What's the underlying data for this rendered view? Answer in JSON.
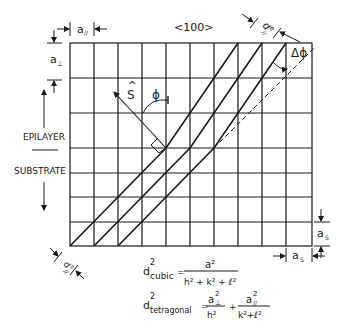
{
  "diagram": {
    "direction_label": "<100>",
    "epilayer_label": "EPILAYER",
    "substrate_label": "SUBSTRATE",
    "a_parallel": {
      "base": "a",
      "sub": "//"
    },
    "a_perp": {
      "base": "a",
      "sub": "⊥"
    },
    "a_s_vertical": {
      "base": "a",
      "sub": "S"
    },
    "a_s_horizontal": {
      "base": "a",
      "sub": "S"
    },
    "d_epi": {
      "base": "d",
      "sup": "e",
      "sub": "//"
    },
    "d_sub": {
      "base": "d",
      "sup": "s",
      "sub": "//"
    },
    "normal_vector": {
      "base": "S",
      "hat": "^"
    },
    "angle_phi": "ϕ",
    "angle_delta_phi": "Δϕ",
    "grid": {
      "columns": 10,
      "epilayer_rows": 3,
      "substrate_rows": 4
    }
  },
  "equations": {
    "cubic": {
      "lhs_base": "d",
      "lhs_sup": "2",
      "lhs_sub": "cubic",
      "numerator": "a²",
      "denominator": "h² + k² + ℓ²"
    },
    "tetragonal": {
      "lhs_base": "d",
      "lhs_sup": "2",
      "lhs_sub": "tetragonal",
      "term1_num_base": "a",
      "term1_num_sup": "2",
      "term1_num_sub": "⊥",
      "term1_den": "h²",
      "plus": "+",
      "term2_num_base": "a",
      "term2_num_sup": "2",
      "term2_num_sub": "//",
      "term2_den": "k²+ℓ²"
    }
  }
}
